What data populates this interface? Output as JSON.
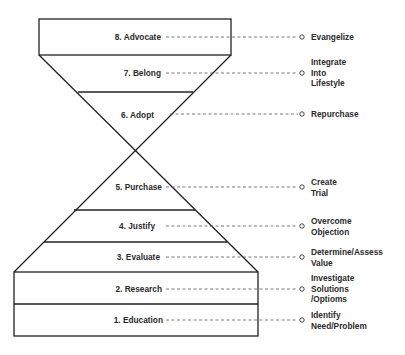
{
  "diagram": {
    "type": "hourglass-funnel",
    "stroke_color": "#222222",
    "stages": [
      {
        "id": 8,
        "label": "8. Advocate",
        "y": 37,
        "label_right": 161,
        "action": [
          "Evangelize"
        ]
      },
      {
        "id": 7,
        "label": "7. Belong",
        "y": 73,
        "label_right": 161,
        "action": [
          "Integrate",
          "Into",
          "Lifestyle"
        ]
      },
      {
        "id": 6,
        "label": "6. Adopt",
        "y": 115,
        "label_right": 154,
        "action": [
          "Repurchase"
        ]
      },
      {
        "id": 5,
        "label": "5. Purchase",
        "y": 187,
        "label_right": 162,
        "action": [
          "Create",
          "Trial"
        ]
      },
      {
        "id": 4,
        "label": "4. Justify",
        "y": 226,
        "label_right": 155,
        "action": [
          "Overcome",
          "Objection"
        ]
      },
      {
        "id": 3,
        "label": "3. Evaluate",
        "y": 257,
        "label_right": 160,
        "action": [
          "Determine/Assess",
          "Value"
        ]
      },
      {
        "id": 2,
        "label": "2. Research",
        "y": 289,
        "label_right": 162,
        "action": [
          "Investigate",
          "Solutions",
          "/Optioms"
        ]
      },
      {
        "id": 1,
        "label": "1. Education",
        "y": 320,
        "label_right": 163,
        "action": [
          "Identify",
          "Need/Problem"
        ]
      }
    ]
  }
}
